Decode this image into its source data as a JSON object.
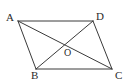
{
  "figure": {
    "type": "geometry-diagram",
    "shape": "parallelogram-with-diagonals",
    "background_color": "#ffffff",
    "stroke_color": "#3a3a3a",
    "label_color": "#2b2b2b",
    "stroke_width": 1,
    "canvas": {
      "width": 129,
      "height": 84
    },
    "points": [
      {
        "id": "A",
        "label": "A",
        "x": 18,
        "y": 21,
        "label_x": 6,
        "label_y": 12
      },
      {
        "id": "D",
        "label": "D",
        "x": 93,
        "y": 21,
        "label_x": 96,
        "label_y": 11
      },
      {
        "id": "B",
        "label": "B",
        "x": 36,
        "y": 69,
        "label_x": 31,
        "label_y": 70
      },
      {
        "id": "C",
        "label": "C",
        "x": 112,
        "y": 69,
        "label_x": 115,
        "label_y": 70
      },
      {
        "id": "O",
        "label": "O",
        "x": 65,
        "y": 44,
        "label_x": 64,
        "label_y": 48
      }
    ],
    "edges": [
      {
        "id": "AD",
        "from": "A",
        "to": "D",
        "role": "side"
      },
      {
        "id": "DC",
        "from": "D",
        "to": "C",
        "role": "side"
      },
      {
        "id": "CB",
        "from": "C",
        "to": "B",
        "role": "side"
      },
      {
        "id": "BA",
        "from": "B",
        "to": "A",
        "role": "side"
      },
      {
        "id": "AC",
        "from": "A",
        "to": "C",
        "role": "diagonal"
      },
      {
        "id": "DB",
        "from": "D",
        "to": "B",
        "role": "diagonal"
      }
    ]
  }
}
